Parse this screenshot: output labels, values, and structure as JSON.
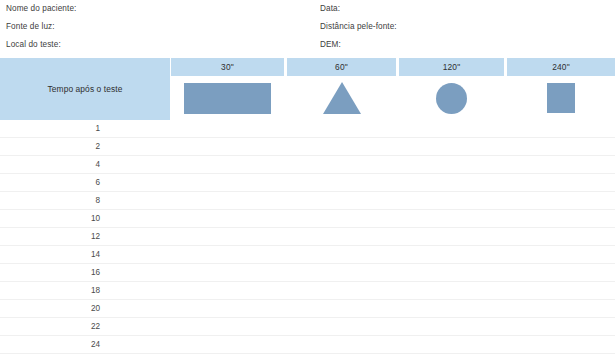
{
  "form_header": {
    "left_fields": [
      "Nome do paciente:",
      "Fonte de luz:",
      "Local do teste:"
    ],
    "right_fields": [
      "Data:",
      "Distância pele-fonte:",
      "DEM:"
    ]
  },
  "table": {
    "row_header_label": "Tempo após o teste",
    "columns": [
      {
        "label": "30\"",
        "shape": "rectangle-shape"
      },
      {
        "label": "60\"",
        "shape": "triangle-shape"
      },
      {
        "label": "120\"",
        "shape": "circle-shape"
      },
      {
        "label": "240\"",
        "shape": "square-shape"
      }
    ],
    "row_labels": [
      "1",
      "2",
      "4",
      "6",
      "8",
      "10",
      "12",
      "14",
      "16",
      "18",
      "20",
      "22",
      "24"
    ]
  },
  "colors": {
    "header_blue": "#bedaef",
    "shape_blue": "#7b9ec0",
    "row_divider": "#f0f0f0",
    "text": "#3a3a3a"
  }
}
